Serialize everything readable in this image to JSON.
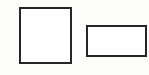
{
  "canvas": {
    "width": 149,
    "height": 75,
    "background": "#fdfdfc"
  },
  "shapes": [
    {
      "name": "square",
      "x": 19,
      "y": 7,
      "width": 53,
      "height": 57,
      "border_color": "#262626",
      "border_width": 2,
      "fill": "#ffffff"
    },
    {
      "name": "rectangle",
      "x": 86,
      "y": 25,
      "width": 61,
      "height": 32,
      "border_color": "#262626",
      "border_width": 2,
      "fill": "#ffffff"
    }
  ]
}
